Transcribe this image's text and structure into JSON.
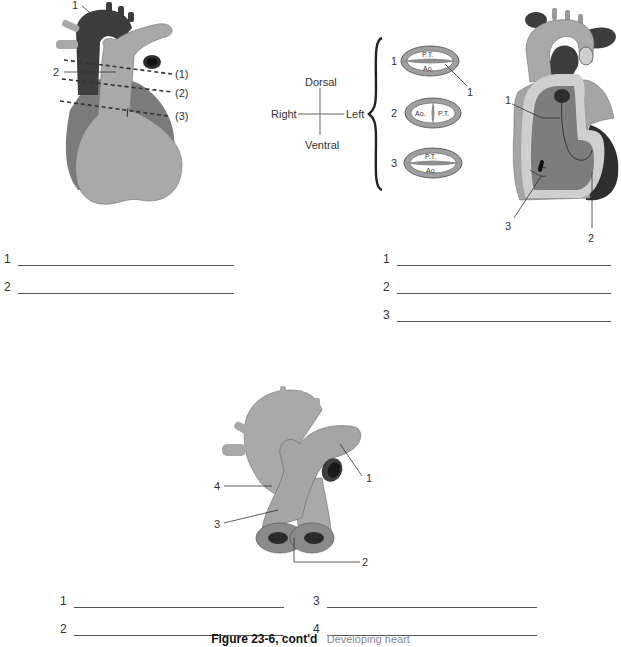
{
  "panel_top_left": {
    "labels": {
      "callout_1": "1",
      "callout_2": "2"
    },
    "section_lines": [
      "(1)",
      "(2)",
      "(3)"
    ],
    "answer_lines": [
      {
        "num": "1",
        "value": ""
      },
      {
        "num": "2",
        "value": ""
      }
    ]
  },
  "panel_top_middle": {
    "orientation": {
      "dorsal": "Dorsal",
      "ventral": "Ventral",
      "right": "Right",
      "left": "Left"
    },
    "sections": [
      {
        "num": "1",
        "top": "P.T.",
        "bottom": "Ao.",
        "layout": "horizontal"
      },
      {
        "num": "2",
        "left": "Ao.",
        "right": "P.T.",
        "layout": "vertical"
      },
      {
        "num": "3",
        "top": "P.T.",
        "bottom": "Ao.",
        "layout": "horizontal"
      }
    ],
    "callout_1": "1"
  },
  "panel_top_right": {
    "labels": {
      "callout_1": "1",
      "callout_2": "2",
      "callout_3": "3"
    },
    "answer_lines": [
      {
        "num": "1",
        "value": ""
      },
      {
        "num": "2",
        "value": ""
      },
      {
        "num": "3",
        "value": ""
      }
    ]
  },
  "panel_bottom": {
    "labels": {
      "callout_1": "1",
      "callout_2": "2",
      "callout_3": "3",
      "callout_4": "4"
    },
    "answer_lines": [
      {
        "num": "1",
        "value": ""
      },
      {
        "num": "3",
        "value": ""
      },
      {
        "num": "2",
        "value": ""
      },
      {
        "num": "4",
        "value": ""
      }
    ]
  },
  "caption": {
    "figure": "Figure 23-6, cont'd",
    "description": "Developing heart"
  },
  "colors": {
    "dark": "#3a3a3a",
    "mid": "#777777",
    "light": "#a9a9a9",
    "lighter": "#c8c8c8",
    "line": "#555555"
  }
}
